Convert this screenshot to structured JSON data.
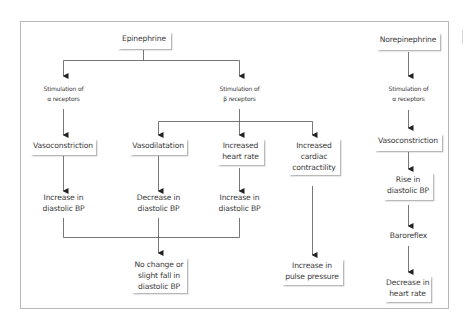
{
  "diagram": {
    "colors": {
      "line": "#555555",
      "frame": "#b8b8b8",
      "text": "#3a3a3a",
      "box_bg": "#ffffff"
    },
    "epinephrine": {
      "root": "Epinephrine",
      "alpha_branch": {
        "label_line1": "Stimulation of",
        "label_line2": "α receptors",
        "effect": "Vasoconstriction",
        "result_line1": "Increase in",
        "result_line2": "diastolic BP"
      },
      "beta_branch": {
        "label_line1": "Stimulation of",
        "label_line2": "β receptors",
        "effects": [
          {
            "line1": "Vasodilatation",
            "result_line1": "Decrease in",
            "result_line2": "diastolic BP"
          },
          {
            "line1": "Increased",
            "line2": "heart rate",
            "result_line1": "Increase in",
            "result_line2": "diastolic BP"
          },
          {
            "line1": "Increased",
            "line2": "cardiac",
            "line3": "contractility",
            "result_line1": "Increase in",
            "result_line2": "pulse pressure"
          }
        ]
      },
      "combined_result": {
        "line1": "No change or",
        "line2": "slight fall in",
        "line3": "diastolic BP"
      }
    },
    "norepinephrine": {
      "root": "Norepinephrine",
      "label_line1": "Stimulation of",
      "label_line2": "α receptors",
      "effect": "Vasoconstriction",
      "result_line1": "Rise in",
      "result_line2": "diastolic BP",
      "reflex": "Baroreflex",
      "final_line1": "Decrease in",
      "final_line2": "heart rate"
    }
  }
}
